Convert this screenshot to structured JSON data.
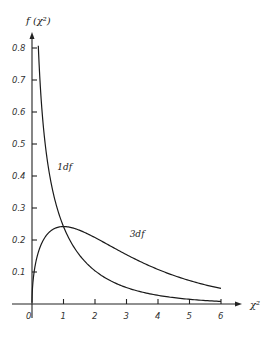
{
  "chart_data": {
    "type": "line",
    "title": "",
    "xlabel": "χ²",
    "ylabel": "f (χ²)",
    "xlim": [
      0,
      6
    ],
    "ylim": [
      0,
      0.8
    ],
    "x_ticks": [
      "0",
      "1",
      "2",
      "3",
      "4",
      "5",
      "6"
    ],
    "y_ticks": [
      "0.1",
      "0.2",
      "0.3",
      "0.4",
      "0.5",
      "0.6",
      "0.7",
      "0.8"
    ],
    "grid": false,
    "legend": "inline curve labels",
    "series": [
      {
        "name": "1df",
        "x": [
          0.2,
          0.3,
          0.5,
          0.75,
          1.0,
          1.5,
          2.0,
          3.0,
          4.0,
          5.0,
          6.0
        ],
        "values": [
          0.81,
          0.63,
          0.44,
          0.32,
          0.24,
          0.15,
          0.1,
          0.05,
          0.03,
          0.015,
          0.008
        ]
      },
      {
        "name": "3df",
        "x": [
          0,
          0.1,
          0.25,
          0.5,
          1.0,
          1.5,
          2.0,
          3.0,
          4.0,
          5.0,
          6.0
        ],
        "values": [
          0,
          0.12,
          0.18,
          0.22,
          0.24,
          0.23,
          0.21,
          0.15,
          0.11,
          0.07,
          0.04
        ]
      }
    ],
    "annotations": [
      {
        "text": "1df",
        "x": 0.8,
        "y": 0.42
      },
      {
        "text": "3df",
        "x": 3.1,
        "y": 0.21
      }
    ]
  }
}
